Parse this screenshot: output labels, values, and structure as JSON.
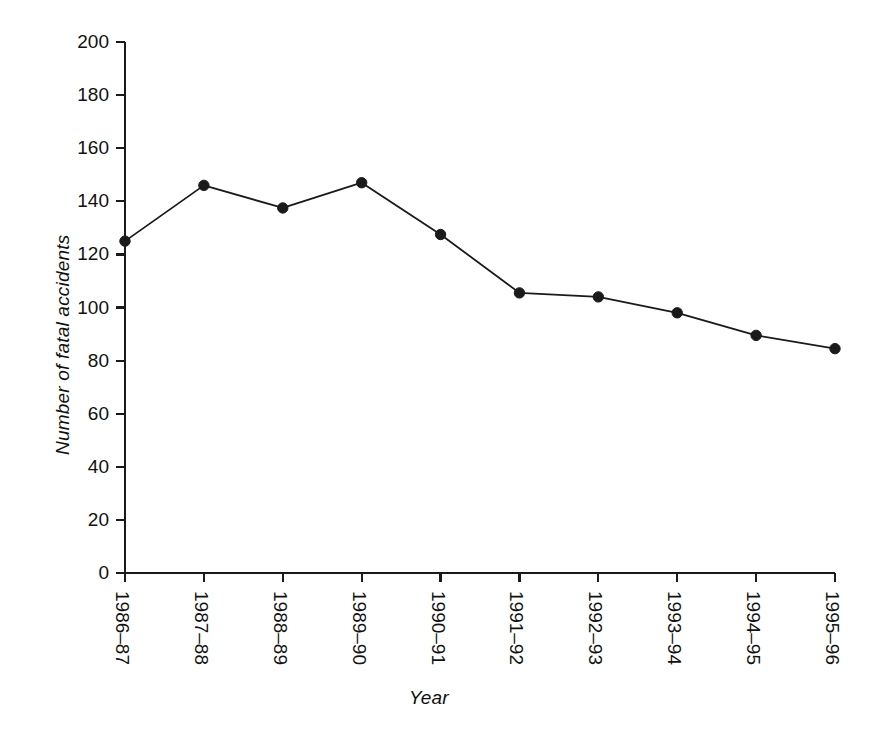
{
  "chart_data": {
    "type": "line",
    "title": "",
    "xlabel": "Year",
    "ylabel": "Number of fatal accidents",
    "categories": [
      "1986–87",
      "1987–88",
      "1988–89",
      "1989–90",
      "1990–91",
      "1991–92",
      "1992–93",
      "1993–94",
      "1994–95",
      "1995–96"
    ],
    "values": [
      125,
      146,
      137.5,
      147,
      127.5,
      105.5,
      104,
      98,
      89.5,
      84.5
    ],
    "series": [
      {
        "name": "Number of fatal accidents",
        "values": [
          125,
          146,
          137.5,
          147,
          127.5,
          105.5,
          104,
          98,
          89.5,
          84.5
        ]
      }
    ],
    "ylim": [
      0,
      200
    ],
    "yticks": [
      0,
      20,
      40,
      60,
      80,
      100,
      120,
      140,
      160,
      180,
      200
    ],
    "ytick_labels": [
      "0",
      "20",
      "40",
      "60",
      "80",
      "100",
      "120",
      "140",
      "160",
      "180",
      "200"
    ],
    "grid": false,
    "legend": false,
    "legend_position": "none",
    "marker": "filled-circle",
    "line_color": "#1a1a1a",
    "marker_color": "#1a1a1a",
    "background_color": "#ffffff",
    "xtick_rotation": 90,
    "spines": [
      "left",
      "bottom"
    ]
  },
  "figure": {
    "plot_left": 125,
    "plot_right": 835,
    "plot_top": 42,
    "plot_bottom": 573
  }
}
